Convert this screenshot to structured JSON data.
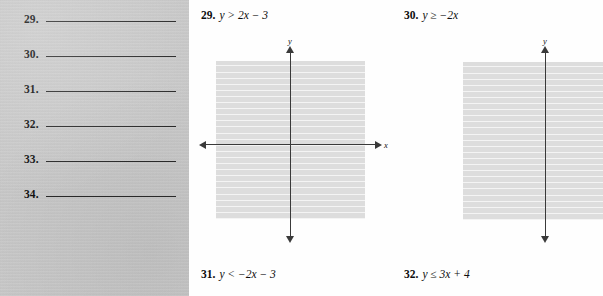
{
  "answer_panel": {
    "rows": [
      {
        "number": "29."
      },
      {
        "number": "30."
      },
      {
        "number": "31."
      },
      {
        "number": "32."
      },
      {
        "number": "33."
      },
      {
        "number": "34."
      }
    ]
  },
  "exercises": [
    {
      "number": "29.",
      "inequality": "y > 2x − 3",
      "variable": "y",
      "relation": ">",
      "expression": "2x − 3",
      "has_graph": true
    },
    {
      "number": "30.",
      "inequality": "y ≥ −2x",
      "variable": "y",
      "relation": "≥",
      "expression": "−2x",
      "has_graph": true
    },
    {
      "number": "31.",
      "inequality": "y < −2x − 3",
      "variable": "y",
      "relation": "<",
      "expression": "−2x − 3",
      "has_graph": false
    },
    {
      "number": "32.",
      "inequality": "y ≤ 3x + 4",
      "variable": "y",
      "relation": "≤",
      "expression": "3x + 4",
      "has_graph": false
    }
  ],
  "graphs": [
    {
      "id": "graph-29",
      "x_axis_label": "x",
      "y_axis_label": "y",
      "grid_color": "#dcdcdc",
      "gridline_color": "#f4f4f4",
      "axis_color": "#3a3a3a",
      "cell_size_px": 6.1,
      "cells_across": 24,
      "cells_down": 26,
      "plotted_curves": []
    },
    {
      "id": "graph-30",
      "x_axis_label": "x",
      "y_axis_label": "y",
      "grid_color": "#dcdcdc",
      "gridline_color": "#f4f4f4",
      "axis_color": "#3a3a3a",
      "cell_size_px": 6.1,
      "cells_across": 22,
      "cells_down": 26,
      "plotted_curves": []
    }
  ],
  "colors": {
    "answer_panel_background": "#c9c9c9",
    "page_background": "#fefefe",
    "text": "#0d0d0d",
    "rule_line": "#2a2a2a"
  }
}
